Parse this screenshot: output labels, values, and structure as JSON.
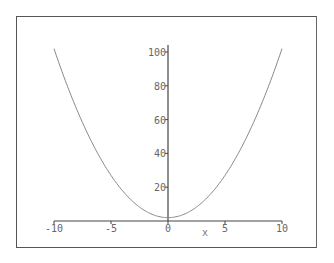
{
  "chart_data": {
    "type": "line",
    "title": "",
    "xlabel": "x",
    "ylabel": "",
    "function": "y = x^2 + 2",
    "xlim": [
      -10,
      10
    ],
    "ylim": [
      0,
      104
    ],
    "x_ticks": [
      -10,
      -5,
      0,
      5,
      10
    ],
    "y_ticks": [
      20,
      40,
      60,
      80,
      100
    ],
    "x_tick_labels": [
      "-10",
      "-5",
      "0",
      "5",
      "10"
    ],
    "y_tick_labels": [
      "20",
      "40",
      "60",
      "80",
      "100"
    ],
    "grid": false,
    "legend": null,
    "series": [
      {
        "name": "curve",
        "color": "#888888",
        "x": [
          -10,
          -8,
          -6,
          -4,
          -2,
          0,
          2,
          4,
          6,
          8,
          10
        ],
        "y": [
          102,
          66,
          38,
          18,
          6,
          2,
          6,
          18,
          38,
          66,
          102
        ]
      }
    ]
  },
  "colors": {
    "axis": "#444444",
    "curve": "#888888",
    "frame": "#555555",
    "labels": "#666666"
  }
}
